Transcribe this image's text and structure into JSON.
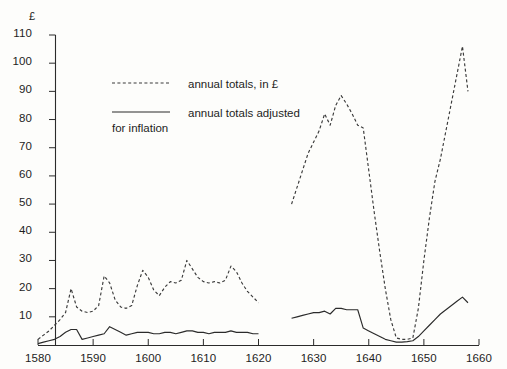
{
  "chart_data": {
    "type": "line",
    "title": "",
    "xlabel": "",
    "ylabel": "£",
    "yunit": "£",
    "xlim": [
      1580,
      1660
    ],
    "ylim": [
      0,
      110
    ],
    "grid": false,
    "legend_position": "upper-left-inside",
    "xticks": [
      1580,
      1590,
      1600,
      1610,
      1620,
      1630,
      1640,
      1650,
      1660
    ],
    "yticks": [
      0,
      10,
      20,
      30,
      40,
      50,
      60,
      70,
      80,
      90,
      100,
      110
    ],
    "series": [
      {
        "name": "annual totals, in £",
        "style": "dashed",
        "color": "#3a3a3a",
        "segments": [
          {
            "x": [
              1580,
              1581,
              1582,
              1583,
              1584,
              1585,
              1586,
              1587,
              1588,
              1589,
              1590,
              1591,
              1592,
              1593,
              1594,
              1595,
              1596,
              1597,
              1598,
              1599,
              1600,
              1601,
              1602,
              1603,
              1604,
              1605,
              1606,
              1607,
              1608,
              1609,
              1610,
              1611,
              1612,
              1613,
              1614,
              1615,
              1616,
              1617,
              1618,
              1619,
              1620
            ],
            "y": [
              2,
              3.5,
              5,
              7,
              9,
              11.5,
              20,
              13.5,
              12,
              11.5,
              12,
              14,
              24.5,
              22,
              16,
              13.5,
              13,
              14,
              21,
              26.5,
              24,
              19.5,
              17.5,
              20.5,
              22.5,
              22,
              23,
              30,
              27,
              24,
              22.5,
              22,
              22.5,
              22,
              23,
              28,
              26,
              22,
              19,
              17,
              15
            ]
          },
          {
            "x": [
              1626,
              1627,
              1628,
              1629,
              1630,
              1631,
              1632,
              1633,
              1634,
              1635,
              1636,
              1637,
              1638,
              1639,
              1640,
              1641,
              1642,
              1643,
              1644,
              1645,
              1646,
              1647,
              1648,
              1649,
              1650,
              1651,
              1652,
              1653,
              1654,
              1655,
              1656,
              1657,
              1658
            ],
            "y": [
              50,
              56,
              62,
              68,
              72,
              76,
              82,
              78,
              85,
              88.5,
              85.5,
              82,
              78,
              77,
              62,
              47,
              33,
              20,
              9,
              2.5,
              2,
              2,
              2.5,
              13,
              30,
              45,
              58,
              66,
              76,
              86,
              96,
              106,
              90
            ]
          }
        ]
      },
      {
        "name": "annual totals adjusted for inflation",
        "style": "solid",
        "color": "#2b2b2b",
        "segments": [
          {
            "x": [
              1580,
              1581,
              1582,
              1583,
              1584,
              1585,
              1586,
              1587,
              1588,
              1589,
              1590,
              1591,
              1592,
              1593,
              1594,
              1595,
              1596,
              1597,
              1598,
              1599,
              1600,
              1601,
              1602,
              1603,
              1604,
              1605,
              1606,
              1607,
              1608,
              1609,
              1610,
              1611,
              1612,
              1613,
              1614,
              1615,
              1616,
              1617,
              1618,
              1619,
              1620
            ],
            "y": [
              0.5,
              1,
              1.5,
              2,
              3,
              4.5,
              5.5,
              5.5,
              2,
              2.5,
              3,
              3.5,
              4,
              6.5,
              5.5,
              4.5,
              3.5,
              4,
              4.5,
              4.5,
              4.5,
              4,
              4,
              4.5,
              4.5,
              4,
              4.5,
              5,
              5,
              4.5,
              4.5,
              4,
              4.5,
              4.5,
              4.5,
              5,
              4.5,
              4.5,
              4.5,
              4,
              4
            ]
          },
          {
            "x": [
              1626,
              1627,
              1628,
              1629,
              1630,
              1631,
              1632,
              1633,
              1634,
              1635,
              1636,
              1637,
              1638,
              1639,
              1640,
              1641,
              1642,
              1643,
              1644,
              1645,
              1646,
              1647,
              1648,
              1649,
              1650,
              1651,
              1652,
              1653,
              1654,
              1655,
              1656,
              1657,
              1658
            ],
            "y": [
              9.5,
              10,
              10.5,
              11,
              11.5,
              11.5,
              12,
              11,
              13,
              13,
              12.5,
              12.5,
              12.5,
              6,
              5,
              4,
              3,
              2,
              1.5,
              1,
              1,
              1.2,
              1.5,
              3,
              5,
              7,
              9,
              11,
              12.5,
              14,
              15.5,
              17,
              15
            ]
          }
        ]
      }
    ]
  },
  "axis": {
    "unit_label": "£",
    "y_tick_labels": [
      "110",
      "100",
      "90",
      "80",
      "70",
      "60",
      "50",
      "40",
      "30",
      "20",
      "10",
      ""
    ],
    "x_tick_labels": [
      "1580",
      "1590",
      "1600",
      "1610",
      "1620",
      "1630",
      "1640",
      "1650",
      "1660"
    ]
  },
  "legend": {
    "items": [
      {
        "label": "annual totals, in £",
        "label_line2": "",
        "style": "dashed"
      },
      {
        "label": "annual totals adjusted",
        "label_line2": "for inflation",
        "style": "solid"
      }
    ]
  }
}
